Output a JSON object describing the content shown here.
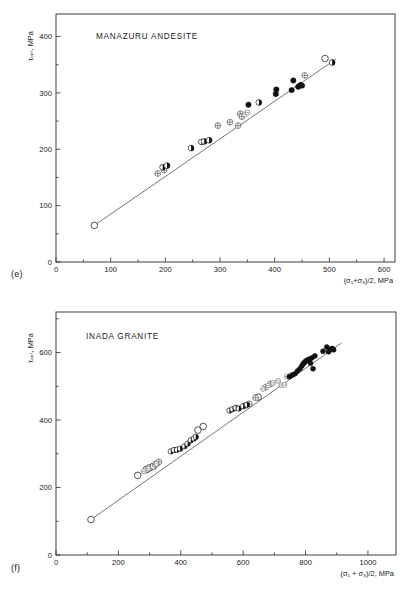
{
  "figure": {
    "panels": [
      {
        "tag": "(e)",
        "title": "MANAZURU ANDESITE",
        "xlabel": "(σ₁+σ₃)/2, MPa",
        "ylabel": "τₒₑₜ, MPa"
      },
      {
        "tag": "(f)",
        "title": "INADA GRANITE",
        "xlabel": "(σ₁ + σ₃)/2, MPa",
        "ylabel": "τₒₑₜ, MPa"
      }
    ]
  },
  "chart_data": [
    {
      "type": "scatter",
      "title": "MANAZURU ANDESITE",
      "panel": "(e)",
      "xlabel": "(σ₁+σ₃)/2, MPa",
      "ylabel": "τₒₑₜ, MPa",
      "xlim": [
        0,
        620
      ],
      "ylim": [
        0,
        440
      ],
      "xticks": [
        0,
        100,
        200,
        300,
        400,
        500,
        600
      ],
      "xtick_labels": [
        "0",
        "100",
        "200",
        "300",
        "400",
        "500",
        "600"
      ],
      "xminor_step": 50,
      "yticks": [
        0,
        100,
        200,
        300,
        400
      ],
      "ytick_labels": [
        "0",
        "100",
        "200",
        "300",
        "400"
      ],
      "yminor_step": 50,
      "grid": false,
      "legend": "none",
      "fit_line": {
        "x": [
          70,
          512
        ],
        "y": [
          65,
          360
        ]
      },
      "series": [
        {
          "name": "open circle",
          "marker": "open-circle",
          "points": [
            [
              70,
              65
            ],
            [
              492,
              361
            ]
          ]
        },
        {
          "name": "crossed circle",
          "marker": "cross-circle",
          "points": [
            [
              186,
              157
            ],
            [
              198,
              163
            ],
            [
              296,
              242
            ],
            [
              318,
              248
            ],
            [
              333,
              242
            ],
            [
              337,
              263
            ],
            [
              340,
              258
            ],
            [
              455,
              331
            ]
          ]
        },
        {
          "name": "half-filled circle",
          "marker": "half-circle",
          "points": [
            [
              195,
              168
            ],
            [
              203,
              171
            ],
            [
              247,
              202
            ],
            [
              266,
              213
            ],
            [
              271,
              214
            ],
            [
              280,
              216
            ],
            [
              371,
              283
            ],
            [
              505,
              354
            ]
          ]
        },
        {
          "name": "solid circle",
          "marker": "solid-circle",
          "points": [
            [
              352,
              279
            ],
            [
              402,
              298
            ],
            [
              403,
              306
            ],
            [
              431,
              305
            ],
            [
              434,
              322
            ],
            [
              443,
              311
            ],
            [
              447,
              314
            ],
            [
              450,
              313
            ]
          ]
        },
        {
          "name": "gray circle",
          "marker": "gray-circle",
          "points": [
            [
              345,
              262
            ],
            [
              350,
              265
            ]
          ]
        }
      ]
    },
    {
      "type": "scatter",
      "title": "INADA GRANITE",
      "panel": "(f)",
      "xlabel": "(σ₁ + σ₃)/2, MPa",
      "ylabel": "τₒₑₜ, MPa",
      "xlim": [
        0,
        1090
      ],
      "ylim": [
        0,
        720
      ],
      "xticks": [
        0,
        200,
        400,
        600,
        800,
        1000
      ],
      "xtick_labels": [
        "0",
        "200",
        "400",
        "600",
        "800",
        "1000"
      ],
      "xminor_step": 100,
      "yticks": [
        0,
        200,
        400,
        600
      ],
      "ytick_labels": [
        "0",
        "200",
        "400",
        "600"
      ],
      "yminor_step": 100,
      "grid": false,
      "legend": "none",
      "fit_line": {
        "x": [
          112,
          915
        ],
        "y": [
          105,
          628
        ]
      },
      "series": [
        {
          "name": "open circle",
          "marker": "open-circle",
          "points": [
            [
              112,
              105
            ],
            [
              262,
              236
            ],
            [
              290,
              253
            ],
            [
              300,
              258
            ],
            [
              312,
              263
            ],
            [
              455,
              370
            ],
            [
              472,
              381
            ],
            [
              648,
              468
            ]
          ]
        },
        {
          "name": "crossed circle",
          "marker": "cross-circle",
          "points": [
            [
              318,
              268
            ],
            [
              325,
              272
            ],
            [
              330,
              276
            ],
            [
              607,
              443
            ],
            [
              620,
              448
            ],
            [
              640,
              466
            ],
            [
              672,
              497
            ],
            [
              688,
              507
            ]
          ]
        },
        {
          "name": "gray circle",
          "marker": "gray-circle",
          "points": [
            [
              281,
              248
            ],
            [
              296,
              256
            ],
            [
              322,
              270
            ],
            [
              600,
              440
            ],
            [
              664,
              492
            ],
            [
              680,
              502
            ],
            [
              695,
              510
            ],
            [
              712,
              516
            ],
            [
              722,
              503
            ],
            [
              732,
              504
            ],
            [
              740,
              529
            ],
            [
              752,
              533
            ]
          ]
        },
        {
          "name": "half-filled circle",
          "marker": "half-circle",
          "points": [
            [
              368,
              307
            ],
            [
              378,
              311
            ],
            [
              388,
              312
            ],
            [
              398,
              315
            ],
            [
              412,
              322
            ],
            [
              422,
              330
            ],
            [
              432,
              340
            ],
            [
              442,
              345
            ],
            [
              448,
              350
            ],
            [
              556,
              428
            ],
            [
              566,
              432
            ],
            [
              576,
              436
            ],
            [
              586,
              434
            ],
            [
              600,
              441
            ],
            [
              612,
              445
            ]
          ]
        },
        {
          "name": "solid circle",
          "marker": "solid-circle",
          "points": [
            [
              748,
              528
            ],
            [
              758,
              533
            ],
            [
              766,
              537
            ],
            [
              774,
              545
            ],
            [
              782,
              552
            ],
            [
              788,
              560
            ],
            [
              792,
              566
            ],
            [
              796,
              570
            ],
            [
              800,
              574
            ],
            [
              804,
              576
            ],
            [
              808,
              578
            ],
            [
              812,
              580
            ],
            [
              816,
              568
            ],
            [
              820,
              584
            ],
            [
              824,
              552
            ],
            [
              830,
              590
            ],
            [
              856,
              604
            ],
            [
              868,
              616
            ],
            [
              874,
              602
            ],
            [
              880,
              610
            ],
            [
              886,
              612
            ],
            [
              890,
              608
            ]
          ]
        }
      ]
    }
  ]
}
